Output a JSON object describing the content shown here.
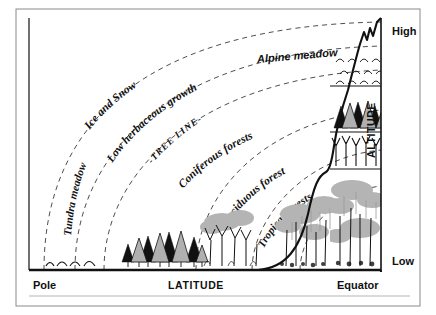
{
  "diagram": {
    "axes": {
      "x_axis_label": "LATITUDE",
      "y_axis_label": "ALTITUDE",
      "x_min_label": "Pole",
      "x_max_label": "Equator",
      "y_min_label": "Low",
      "y_max_label": "High"
    },
    "zone_labels": [
      {
        "id": "ice-and-snow",
        "text": "Ice and Snow"
      },
      {
        "id": "low-herbaceous-growth",
        "text": "Low herbaceous growth"
      },
      {
        "id": "tree-line",
        "text": "TREE LINE"
      },
      {
        "id": "tundra-meadow",
        "text": "Tundra meadow"
      },
      {
        "id": "coniferous-forests",
        "text": "Coniferous forests"
      },
      {
        "id": "deciduous-forest",
        "text": "Deciduous forest"
      },
      {
        "id": "tropical-forests",
        "text": "Tropical forests"
      },
      {
        "id": "alpine-meadow",
        "text": "Alpine meadow"
      }
    ],
    "colors": {
      "ink": "#111111",
      "canopy_gray": "#b7b7b7",
      "canopy_gray_dark": "#9a9a9a",
      "tree_gray": "#b0b0b0",
      "frame": "#7a7a7a",
      "background": "#ffffff"
    }
  }
}
